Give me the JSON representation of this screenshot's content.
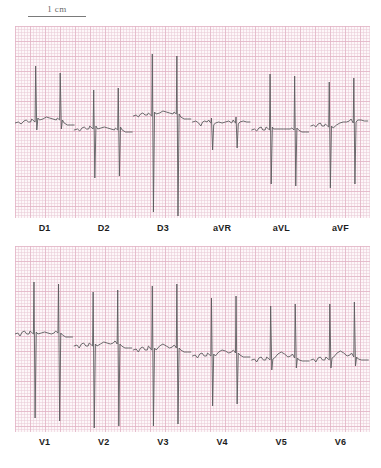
{
  "document": {
    "type": "12-lead electrocardiogram",
    "paper_color": "#fdf7f9",
    "grid_major_color": "#e2b2c4",
    "grid_minor_color": "#e9cbd7",
    "trace_color": "#5b5b5d"
  },
  "calibration": {
    "label": "1 cm",
    "icon": "scale-bar-icon"
  },
  "rows": [
    {
      "name": "limb-leads",
      "labels": [
        "D1",
        "D2",
        "D3",
        "aVR",
        "aVL",
        "aVF"
      ]
    },
    {
      "name": "chest-leads",
      "labels": [
        "V1",
        "V2",
        "V3",
        "V4",
        "V5",
        "V6"
      ]
    }
  ],
  "chart_data": {
    "type": "line",
    "xlabel": "",
    "ylabel": "",
    "grid": true,
    "legend": "none",
    "annotations": [
      "1 cm"
    ],
    "units": {
      "x": "time (ECG paper, 1 large square = 0.2 s)",
      "y": "voltage (ECG paper, 1 large square = 0.5 mV)"
    },
    "panels": [
      {
        "lead": "D1",
        "row": 1,
        "description": "Two beats, tall upright R waves, small q, shallow S, upright T",
        "beats": 2,
        "r_amplitude_mm": 14,
        "s_amplitude_mm": 2,
        "path": "M0,97 L6,96 L11,98 L16,95 L20,94 L24,96 L28,96 L30,93 L32,94 L34,95 L36,96 L37,40 L39,104 L41,92 L44,94 L50,93 L56,91 L62,92 L68,93 L74,94 L76,92 L78,93 L80,94 L81,47 L83,103 L85,94 L88,97 L94,99 L100,99 L106,99"
      },
      {
        "lead": "D2",
        "row": 1,
        "description": "Two beats, tall R waves with deep S waves",
        "beats": 2,
        "r_amplitude_mm": 12,
        "s_amplitude_mm": 18,
        "path": "M0,104 L6,103 L10,105 L14,102 L18,101 L22,103 L26,103 L28,100 L30,101 L32,102 L34,103 L35,64 L37,152 L39,100 L42,103 L48,102 L54,101 L60,102 L66,103 L72,104 L74,102 L76,103 L78,104 L79,62 L81,150 L83,101 L86,104 L92,106 L98,106 L104,106"
      },
      {
        "lead": "D3",
        "row": 1,
        "description": "Two beats, very tall R waves with very deep S waves extending beyond panel",
        "beats": 2,
        "r_amplitude_mm": 22,
        "s_amplitude_mm": 30,
        "path": "M0,90 L5,89 L9,91 L13,88 L17,87 L21,89 L25,89 L27,87 L29,88 L31,89 L33,90 L34,28 L36,186 L38,86 L41,88 L47,87 L53,85 L59,86 L65,87 L71,88 L73,86 L75,87 L77,88 L78,30 L80,190 L82,88 L85,91 L91,93 L97,93 L103,93"
      },
      {
        "lead": "aVR",
        "row": 1,
        "description": "Two beats, predominantly negative QRS complexes, inverted P and T",
        "beats": 2,
        "r_amplitude_mm": 2,
        "s_amplitude_mm": 7,
        "path": "M0,96 L6,95 L11,97 L15,100 L18,96 L22,95 L26,96 L29,94 L31,96 L33,97 L34,92 L36,124 L38,99 L41,97 L47,96 L53,97 L59,96 L65,95 L70,97 L73,94 L75,96 L77,97 L78,91 L80,122 L82,98 L85,96 L91,95 L97,96 L103,96"
      },
      {
        "lead": "aVL",
        "row": 1,
        "description": "Two beats, tall R waves with deep S waves and flat ST segment",
        "beats": 2,
        "r_amplitude_mm": 16,
        "s_amplitude_mm": 20,
        "path": "M0,104 L5,103 L9,105 L13,102 L17,101 L20,104 L24,104 L26,101 L28,102 L30,103 L32,104 L33,48 L35,158 L37,101 L39,103 L45,103 L51,103 L57,103 L63,103 L69,103 L72,102 L74,103 L76,104 L77,50 L79,160 L81,102 L84,104 L90,106 L96,106 L102,106"
      },
      {
        "lead": "aVF",
        "row": 1,
        "description": "Two beats, tall R waves with deep S waves, rising ST-T",
        "beats": 2,
        "r_amplitude_mm": 14,
        "s_amplitude_mm": 20,
        "path": "M0,100 L5,99 L9,101 L13,98 L17,97 L20,100 L24,100 L26,98 L28,99 L30,100 L32,101 L33,56 L35,162 L37,100 L40,102 L46,99 L52,97 L58,96 L64,96 L69,95 L72,93 L74,95 L76,97 L77,52 L79,158 L81,96 L84,94 L90,94 L96,95 L102,95"
      },
      {
        "lead": "V1",
        "row": 2,
        "description": "Two beats, tall R waves with extremely deep S waves",
        "beats": 2,
        "r_amplitude_mm": 18,
        "s_amplitude_mm": 34,
        "path": "M0,88 L5,87 L9,90 L13,86 L17,85 L21,88 L25,88 L27,85 L29,86 L31,87 L33,88 L34,36 L36,172 L38,86 L41,88 L47,87 L53,86 L59,87 L65,88 L70,87 L73,85 L75,86 L77,87 L78,38 L80,175 L82,87 L85,89 L91,91 L97,91 L103,91"
      },
      {
        "lead": "V2",
        "row": 2,
        "description": "Two beats, tall R waves with extremely deep S waves below panel",
        "beats": 2,
        "r_amplitude_mm": 20,
        "s_amplitude_mm": 36,
        "path": "M0,100 L5,99 L9,102 L13,98 L17,97 L21,100 L25,100 L27,97 L29,98 L31,99 L33,100 L34,46 L36,182 L38,98 L41,100 L47,98 L53,96 L59,97 L65,98 L70,97 L73,95 L75,96 L77,98 L78,44 L80,180 L82,98 L85,100 L91,102 L97,102 L103,102"
      },
      {
        "lead": "V3",
        "row": 2,
        "description": "Two beats, very tall R waves with very deep S waves",
        "beats": 2,
        "r_amplitude_mm": 22,
        "s_amplitude_mm": 32,
        "path": "M0,104 L5,103 L9,106 L13,102 L17,101 L21,104 L25,104 L27,100 L29,101 L31,103 L33,104 L34,40 L36,180 L38,102 L41,104 L47,100 L53,98 L59,100 L65,102 L70,101 L73,99 L75,100 L77,102 L78,38 L80,178 L82,102 L85,104 L91,106 L97,106 L103,106"
      },
      {
        "lead": "V4",
        "row": 2,
        "description": "Two beats, tall R waves with deep S waves, notched T waves",
        "beats": 2,
        "r_amplitude_mm": 18,
        "s_amplitude_mm": 22,
        "path": "M0,110 L5,109 L9,112 L13,108 L17,107 L21,110 L25,110 L27,107 L29,108 L31,109 L33,110 L34,52 L36,160 L38,108 L41,110 L47,106 L53,104 L59,105 L65,107 L70,106 L73,104 L75,105 L77,107 L78,50 L80,158 L82,107 L85,109 L91,111 L97,111 L103,111"
      },
      {
        "lead": "V5",
        "row": 2,
        "description": "Two beats, tall R waves with small S waves, upright T",
        "beats": 2,
        "r_amplitude_mm": 14,
        "s_amplitude_mm": 3,
        "path": "M0,114 L5,113 L9,116 L13,112 L17,111 L21,114 L25,114 L27,111 L29,112 L31,113 L33,114 L34,60 L36,124 L38,113 L41,112 L47,108 L53,106 L59,108 L65,111 L70,110 L73,108 L75,110 L77,112 L78,58 L80,122 L82,112 L85,114 L91,115 L97,115 L103,115"
      },
      {
        "lead": "V6",
        "row": 2,
        "description": "Two beats, tall R waves with minimal S waves, upright T",
        "beats": 2,
        "r_amplitude_mm": 14,
        "s_amplitude_mm": 2,
        "path": "M0,114 L5,113 L9,116 L13,112 L17,111 L21,114 L25,114 L27,111 L29,112 L31,113 L33,114 L34,58 L36,122 L38,112 L41,111 L47,107 L53,105 L59,107 L65,110 L70,109 L73,107 L75,109 L77,111 L78,56 L80,120 L82,111 L85,113 L91,114 L97,114 L103,114"
      }
    ]
  }
}
